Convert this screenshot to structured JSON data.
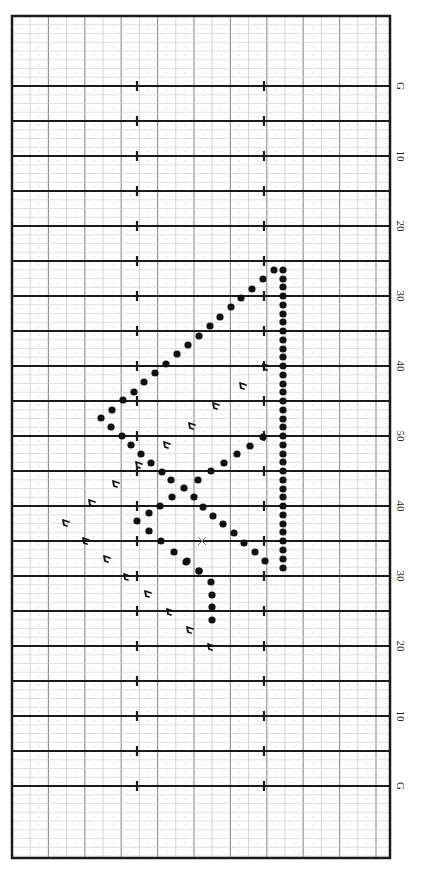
{
  "chart_data": {
    "type": "scatter",
    "orientation": "field rotated 90°, goal lines horizontal, sideline labels on right",
    "yard_labels": [
      "G",
      "10",
      "20",
      "30",
      "40",
      "50",
      "40",
      "30",
      "20",
      "10",
      "G"
    ],
    "yard_line_labeled_positions_y": [
      86,
      156,
      226,
      296,
      366,
      436,
      506,
      576,
      646,
      716,
      786
    ],
    "frame": {
      "x0": 12,
      "y0": 16,
      "x1": 390,
      "y1": 858
    },
    "yard_line_spacing_px": 35,
    "first_yard_line_y": 86,
    "yard_line_count": 21,
    "hash_marks_x": [
      137,
      264
    ],
    "grid": {
      "minor_col_px": 18.2,
      "minor_row_px": 8.75,
      "on": true
    },
    "dots": [
      [
        274,
        270
      ],
      [
        263,
        279
      ],
      [
        252,
        289
      ],
      [
        241,
        298
      ],
      [
        231,
        307
      ],
      [
        220,
        317
      ],
      [
        210,
        326
      ],
      [
        199,
        336
      ],
      [
        188,
        345
      ],
      [
        177,
        354
      ],
      [
        166,
        364
      ],
      [
        155,
        373
      ],
      [
        144,
        382
      ],
      [
        134,
        392
      ],
      [
        123,
        400
      ],
      [
        112,
        410
      ],
      [
        101,
        418
      ],
      [
        111,
        427
      ],
      [
        122,
        436
      ],
      [
        131,
        445
      ],
      [
        141,
        454
      ],
      [
        151,
        463
      ],
      [
        162,
        472
      ],
      [
        171,
        480
      ],
      [
        184,
        488
      ],
      [
        172,
        497
      ],
      [
        160,
        506
      ],
      [
        149,
        513
      ],
      [
        137,
        521
      ],
      [
        149,
        531
      ],
      [
        161,
        541
      ],
      [
        174,
        552
      ],
      [
        186,
        562
      ],
      [
        199,
        571
      ],
      [
        263,
        437
      ],
      [
        250,
        446
      ],
      [
        237,
        454
      ],
      [
        224,
        463
      ],
      [
        211,
        471
      ],
      [
        198,
        480
      ],
      [
        194,
        497
      ],
      [
        203,
        507
      ],
      [
        213,
        516
      ],
      [
        223,
        524
      ],
      [
        234,
        533
      ],
      [
        244,
        543
      ],
      [
        255,
        552
      ],
      [
        265,
        561
      ],
      [
        187,
        561
      ],
      [
        199,
        571
      ],
      [
        211,
        582
      ],
      [
        212,
        595
      ],
      [
        212,
        607
      ],
      [
        212,
        620
      ],
      [
        283,
        270
      ],
      [
        283,
        279
      ],
      [
        283,
        287
      ],
      [
        283,
        296
      ],
      [
        283,
        305
      ],
      [
        283,
        314
      ],
      [
        283,
        322
      ],
      [
        283,
        331
      ],
      [
        283,
        340
      ],
      [
        283,
        349
      ],
      [
        283,
        357
      ],
      [
        283,
        366
      ],
      [
        283,
        375
      ],
      [
        283,
        384
      ],
      [
        283,
        392
      ],
      [
        283,
        401
      ],
      [
        283,
        410
      ],
      [
        283,
        419
      ],
      [
        283,
        427
      ],
      [
        283,
        436
      ],
      [
        283,
        445
      ],
      [
        283,
        454
      ],
      [
        283,
        462
      ],
      [
        283,
        471
      ],
      [
        283,
        480
      ],
      [
        283,
        489
      ],
      [
        283,
        497
      ],
      [
        283,
        506
      ],
      [
        283,
        515
      ],
      [
        283,
        524
      ],
      [
        283,
        532
      ],
      [
        283,
        541
      ],
      [
        283,
        550
      ],
      [
        283,
        559
      ],
      [
        283,
        568
      ]
    ],
    "flags": [
      [
        266,
        367
      ],
      [
        243,
        386
      ],
      [
        216,
        406
      ],
      [
        192,
        426
      ],
      [
        167,
        445
      ],
      [
        139,
        465
      ],
      [
        116,
        484
      ],
      [
        92,
        503
      ],
      [
        66,
        523
      ],
      [
        86,
        541
      ],
      [
        107,
        559
      ],
      [
        127,
        577
      ],
      [
        148,
        594
      ],
      [
        170,
        612
      ],
      [
        190,
        630
      ],
      [
        211,
        647
      ]
    ],
    "x_marks": [
      [
        202,
        541
      ]
    ]
  },
  "labels": {
    "g_top": "G",
    "ten_top": "10",
    "twenty_top": "20",
    "thirty_top": "30",
    "forty_top": "40",
    "fifty": "50",
    "forty_bottom": "40",
    "thirty_bottom": "30",
    "twenty_bottom": "20",
    "ten_bottom": "10",
    "g_bottom": "G"
  }
}
